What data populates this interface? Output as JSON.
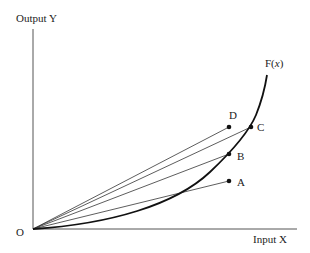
{
  "diagram": {
    "type": "production-function",
    "axes": {
      "y_label": "Output Y",
      "x_label": "Input X",
      "origin_label": "O"
    },
    "curve": {
      "label_prefix": "F(",
      "label_var": "x",
      "label_suffix": ")"
    },
    "points": [
      {
        "label": "A",
        "on_curve": false
      },
      {
        "label": "B",
        "on_curve": true
      },
      {
        "label": "C",
        "on_curve": true
      },
      {
        "label": "D",
        "on_curve": false
      }
    ],
    "colors": {
      "axis": "#555555",
      "curve": "#111111",
      "ray": "#333333",
      "point": "#111111",
      "text": "#222222"
    }
  }
}
